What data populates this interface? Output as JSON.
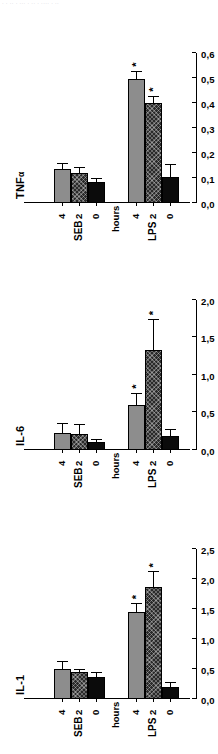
{
  "figure": {
    "top_fragment": "· · ·· · ··· · ·· · ···· · ··",
    "orientation": "rotated-90-ccw",
    "axis_title": "cDNA/cf",
    "group_labels": [
      "LPS",
      "SEB"
    ],
    "time_axis_label": "hours",
    "time_ticks": [
      "0",
      "2",
      "4"
    ],
    "significance_marker": "*",
    "colors": {
      "bar_0h": "#0b0b0b",
      "bar_2h": "#2a2a2a",
      "bar_4h": "#8d8d8d",
      "axis": "#000000",
      "background": "#ffffff"
    },
    "series_styles": [
      "solid-black",
      "hatched",
      "solid-gray"
    ]
  },
  "chart_data": [
    {
      "type": "bar",
      "title": "TNFα",
      "title_main": "TNF",
      "title_sub": "α",
      "xlabel": "hours",
      "ylabel": "cDNA/cf",
      "ylim": [
        0,
        0.6
      ],
      "yticks": [
        0,
        0.1,
        0.2,
        0.3,
        0.4,
        0.5,
        0.6
      ],
      "ytick_labels": [
        "0,0",
        "0,1",
        "0,2",
        "0,3",
        "0,4",
        "0,5",
        "0,6"
      ],
      "grid": false,
      "legend": "none",
      "groups": [
        "LPS",
        "SEB"
      ],
      "categories": [
        "0",
        "2",
        "4",
        "0",
        "2",
        "4"
      ],
      "values": [
        0.105,
        0.4,
        0.495,
        0.085,
        0.12,
        0.135
      ],
      "errors": [
        0.045,
        0.025,
        0.03,
        0.012,
        0.02,
        0.02
      ],
      "significant": [
        false,
        true,
        true,
        false,
        false,
        false
      ]
    },
    {
      "type": "bar",
      "title": "IL-6",
      "title_main": "IL-6",
      "title_sub": "",
      "xlabel": "hours",
      "ylabel": "cDNA/cf",
      "ylim": [
        0,
        2.0
      ],
      "yticks": [
        0,
        0.5,
        1.0,
        1.5,
        2.0
      ],
      "ytick_labels": [
        "0,0",
        "0,5",
        "1,0",
        "1,5",
        "2,0"
      ],
      "grid": false,
      "legend": "none",
      "groups": [
        "LPS",
        "SEB"
      ],
      "categories": [
        "0",
        "2",
        "4",
        "0",
        "2",
        "4"
      ],
      "values": [
        0.19,
        1.33,
        0.6,
        0.11,
        0.21,
        0.22
      ],
      "errors": [
        0.07,
        0.4,
        0.15,
        0.02,
        0.12,
        0.13
      ],
      "significant": [
        false,
        true,
        true,
        false,
        false,
        false
      ]
    },
    {
      "type": "bar",
      "title": "IL-1",
      "title_main": "IL-1",
      "title_sub": "",
      "xlabel": "hours",
      "ylabel": "cDNA/cf",
      "ylim": [
        0,
        2.5
      ],
      "yticks": [
        0,
        0.5,
        1.0,
        1.5,
        2.0,
        2.5
      ],
      "ytick_labels": [
        "0,0",
        "0,5",
        "1,0",
        "1,5",
        "2,0",
        "2,5"
      ],
      "grid": false,
      "legend": "none",
      "groups": [
        "LPS",
        "SEB"
      ],
      "categories": [
        "0",
        "2",
        "4",
        "0",
        "2",
        "4"
      ],
      "values": [
        0.2,
        1.86,
        1.45,
        0.37,
        0.45,
        0.5
      ],
      "errors": [
        0.06,
        0.25,
        0.13,
        0.07,
        0.03,
        0.12
      ],
      "significant": [
        false,
        true,
        true,
        false,
        false,
        false
      ]
    }
  ]
}
